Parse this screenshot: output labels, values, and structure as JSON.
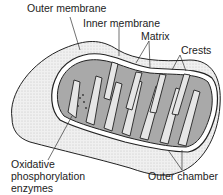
{
  "diagram": {
    "labels": {
      "outer_membrane": "Outer membrane",
      "inner_membrane": "Inner membrane",
      "matrix": "Matrix",
      "crests": "Crests",
      "outer_chamber": "Outer chamber",
      "oxphos_line1": "Oxidative",
      "oxphos_line2": "phosphorylation",
      "oxphos_line3": "enzymes"
    },
    "colors": {
      "outer_body": "#ececec",
      "matrix_fill": "#a9a9a9",
      "outline": "#222222"
    }
  }
}
